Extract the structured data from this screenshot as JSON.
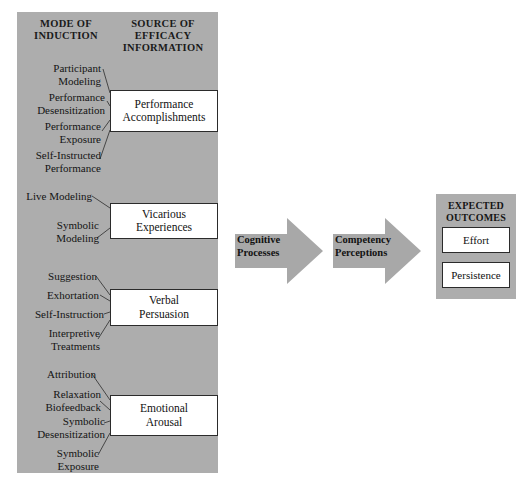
{
  "diagram": {
    "title_columns": {
      "mode_of_induction": "MODE OF\nINDUCTION",
      "mode_line1": "MODE OF",
      "mode_line2": "INDUCTION",
      "source_line1": "SOURCE OF",
      "source_line2": "EFFICACY",
      "source_line3": "INFORMATION"
    },
    "colors": {
      "panel_gray": "#adadad",
      "arrow_gray": "#a8a8a8",
      "box_white": "#ffffff",
      "line_dark": "#2b2b2b",
      "text_dark": "#141414"
    },
    "groups": [
      {
        "source_label_line1": "Performance",
        "source_label_line2": "Accomplishments",
        "inductions": [
          {
            "line1": "Participant",
            "line2": "Modeling"
          },
          {
            "line1": "Performance",
            "line2": "Desensitization"
          },
          {
            "line1": "Performance",
            "line2": "Exposure"
          },
          {
            "line1": "Self-Instructed",
            "line2": "Performance"
          }
        ]
      },
      {
        "source_label_line1": "Vicarious",
        "source_label_line2": "Experiences",
        "inductions": [
          {
            "line1": "Live Modeling",
            "line2": ""
          },
          {
            "line1": "Symbolic",
            "line2": "Modeling"
          }
        ]
      },
      {
        "source_label_line1": "Verbal",
        "source_label_line2": "Persuasion",
        "inductions": [
          {
            "line1": "Suggestion",
            "line2": ""
          },
          {
            "line1": "Exhortation",
            "line2": ""
          },
          {
            "line1": "Self-Instruction",
            "line2": ""
          },
          {
            "line1": "Interpretive",
            "line2": "Treatments"
          }
        ]
      },
      {
        "source_label_line1": "Emotional",
        "source_label_line2": "Arousal",
        "inductions": [
          {
            "line1": "Attribution",
            "line2": ""
          },
          {
            "line1": "Relaxation",
            "line2": "Biofeedback"
          },
          {
            "line1": "Symbolic",
            "line2": "Desensitization"
          },
          {
            "line1": "Symbolic",
            "line2": "Exposure"
          }
        ]
      }
    ],
    "arrows": [
      {
        "line1": "Cognitive",
        "line2": "Processes"
      },
      {
        "line1": "Competency",
        "line2": "Perceptions"
      }
    ],
    "outcomes": {
      "title_line1": "EXPECTED",
      "title_line2": "OUTCOMES",
      "items": [
        {
          "label": "Effort"
        },
        {
          "label": "Persistence"
        }
      ]
    }
  }
}
